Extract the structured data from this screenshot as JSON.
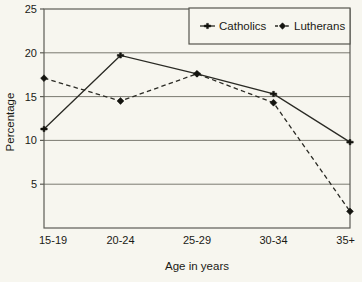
{
  "chart_data": {
    "type": "line",
    "title": "",
    "xlabel": "Age in years",
    "ylabel": "Percentage",
    "categories": [
      "15-19",
      "20-24",
      "25-29",
      "30-34",
      "35+"
    ],
    "series": [
      {
        "name": "Catholics",
        "values": [
          11.3,
          19.7,
          17.6,
          15.3,
          9.8
        ],
        "linestyle": "solid",
        "marker": "plus",
        "color": "#2a2a24"
      },
      {
        "name": "Lutherans",
        "values": [
          17.1,
          14.5,
          17.6,
          14.3,
          1.9
        ],
        "linestyle": "dashed",
        "marker": "diamond",
        "color": "#2a2a24"
      }
    ],
    "ylim": [
      0,
      25
    ],
    "yticks": [
      5,
      10,
      15,
      20,
      25
    ],
    "ytick_labels": [
      "5",
      "10",
      "15",
      "20",
      "25"
    ],
    "grid": true,
    "grid_axis": "y",
    "legend_position": "top-right",
    "background_color": "#f7f6ef",
    "axis_color": "#5d5d55"
  }
}
